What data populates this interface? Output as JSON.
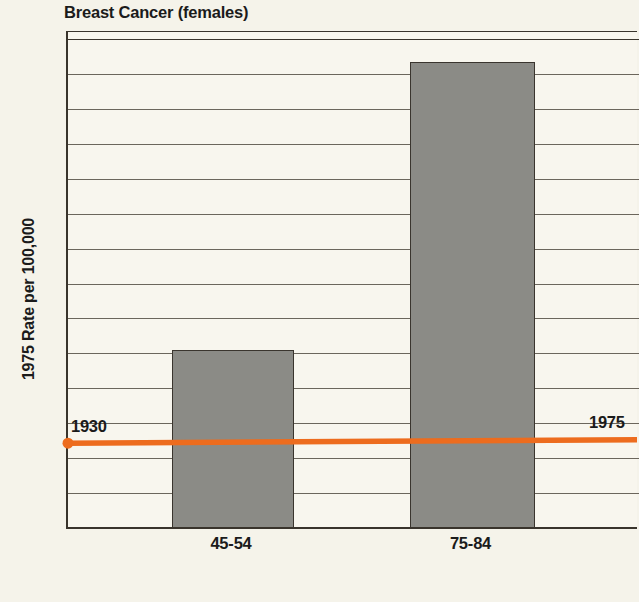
{
  "chart_data": {
    "type": "bar",
    "title": "Breast Cancer (females)",
    "xlabel": "Age Group (yr)",
    "ylabel": "1975 Rate per 100,000",
    "categories": [
      "45-54",
      "75-84"
    ],
    "values": [
      51,
      133.5
    ],
    "ylim": [
      0,
      140
    ],
    "yticks": [
      140,
      130,
      120,
      110,
      100,
      90,
      80,
      70,
      60,
      50,
      40,
      30,
      20,
      10
    ],
    "grid": true,
    "legend": "none",
    "series": [
      {
        "name": "1975 Rate per 100,000",
        "type": "bar",
        "values": [
          51,
          133.5
        ],
        "color": "#8b8b86"
      },
      {
        "name": "trend-line",
        "type": "line",
        "color": "#ED6C1E",
        "x": [
          "1930",
          "1975"
        ],
        "values": [
          24,
          25
        ],
        "annotations": [
          {
            "label": "1930",
            "value": 24,
            "position": "left"
          },
          {
            "label": "1975",
            "value": 25,
            "position": "right"
          }
        ]
      }
    ],
    "colors": {
      "bar_fill": "#8b8b86",
      "bar_border": "#3a352e",
      "trend_line": "#ED6C1E",
      "background": "#f5f3ea",
      "plot_background": "#f8f6ee",
      "gridline": "#6b665c",
      "axis": "#39342c",
      "text": "#1b1b1b"
    }
  },
  "chart": {
    "title": "Breast Cancer (females)",
    "y_axis_title": "1975 Rate per 100,000",
    "x_axis_title": "Age Group (yr)",
    "y_ticks": [
      {
        "label": "140"
      },
      {
        "label": "130"
      },
      {
        "label": "120"
      },
      {
        "label": "110"
      },
      {
        "label": "100"
      },
      {
        "label": "90"
      },
      {
        "label": "80"
      },
      {
        "label": "70"
      },
      {
        "label": "60"
      },
      {
        "label": "50"
      },
      {
        "label": "40"
      },
      {
        "label": "30"
      },
      {
        "label": "20"
      },
      {
        "label": "10"
      }
    ],
    "x_ticks": [
      {
        "label": "45-54"
      },
      {
        "label": "75-84"
      }
    ],
    "bars": [
      {
        "category": "45-54",
        "value": 51
      },
      {
        "category": "75-84",
        "value": 133.5
      }
    ],
    "trend": {
      "start_label": "1930",
      "end_label": "1975",
      "start_value": 24,
      "end_value": 25
    }
  }
}
